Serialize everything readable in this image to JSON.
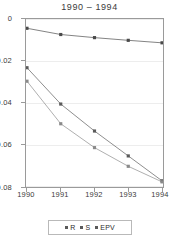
{
  "figure": {
    "cropped_header_text": "",
    "title": "1990  –  1994"
  },
  "legend": {
    "position": "bottom-center",
    "items": [
      {
        "label": "R",
        "marker": "square-marker",
        "color": "#5a5a5a"
      },
      {
        "label": "S",
        "marker": "square-marker",
        "color": "#8a8a8a"
      },
      {
        "label": "EPV",
        "marker": "square-marker",
        "color": "#4a4a4a"
      }
    ]
  },
  "axes": {
    "y_ticks": [
      "0",
      "-0.02",
      "-0.04",
      "-0.06",
      "-0.08"
    ],
    "y_tick_values": [
      0,
      -0.02,
      -0.04,
      -0.06,
      -0.08
    ],
    "x_ticks": [
      "1990",
      "1991",
      "1992",
      "1993",
      "1994"
    ],
    "x_tick_values": [
      1990,
      1991,
      1992,
      1993,
      1994
    ]
  },
  "chart_data": {
    "type": "line",
    "title": "1990  –  1994",
    "xlabel": "",
    "ylabel": "",
    "x": [
      1990,
      1991,
      1992,
      1993,
      1994
    ],
    "categories": [
      "1990",
      "1991",
      "1992",
      "1993",
      "1994"
    ],
    "xlim": [
      1990,
      1994
    ],
    "ylim": [
      -0.08,
      0
    ],
    "grid": true,
    "grid_axis": "y",
    "legend": [
      "R",
      "S",
      "EPV"
    ],
    "legend_position": "bottom-center",
    "series": [
      {
        "name": "EPV",
        "color": "#4a4a4a",
        "marker": "square",
        "values": [
          -0.004,
          -0.007,
          -0.0085,
          -0.0098,
          -0.011
        ]
      },
      {
        "name": "R",
        "color": "#5a5a5a",
        "marker": "square",
        "values": [
          -0.023,
          -0.0405,
          -0.0535,
          -0.0655,
          -0.0775
        ]
      },
      {
        "name": "S",
        "color": "#8a8a8a",
        "marker": "square",
        "values": [
          -0.0295,
          -0.05,
          -0.0615,
          -0.0705,
          -0.078
        ]
      }
    ]
  },
  "colors": {
    "frame": "#9a9a9a",
    "gridline": "#ededed",
    "background": "#ffffff",
    "text": "#3b3b3b"
  }
}
